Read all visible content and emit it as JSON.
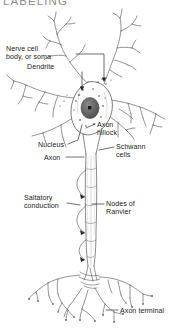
{
  "heading": "LABELING",
  "figure": {
    "style": "pencil-sketch line art",
    "background_color": "#ffffff",
    "ink_color": "#4a4a4a",
    "nucleus_color": "#6b6b6b"
  },
  "labels": [
    {
      "id": "soma",
      "text": "Nerve cell\nbody, or soma",
      "x": 6,
      "y": 45,
      "align": "left"
    },
    {
      "id": "dendrite",
      "text": "Dendrite",
      "x": 27,
      "y": 63,
      "align": "left"
    },
    {
      "id": "axon-hillock",
      "text": "Axon\nhillock",
      "x": 97,
      "y": 121,
      "align": "left"
    },
    {
      "id": "nucleus",
      "text": "Nucleus",
      "x": 38,
      "y": 141,
      "align": "left"
    },
    {
      "id": "schwann",
      "text": "Schwann\ncells",
      "x": 116,
      "y": 143,
      "align": "left"
    },
    {
      "id": "axon",
      "text": "Axon",
      "x": 44,
      "y": 154,
      "align": "left"
    },
    {
      "id": "saltatory",
      "text": "Saltatory\nconduction",
      "x": 24,
      "y": 194,
      "align": "left"
    },
    {
      "id": "nodes",
      "text": "Nodes of\nRanvier",
      "x": 106,
      "y": 200,
      "align": "left"
    },
    {
      "id": "terminal",
      "text": "Axon terminal",
      "x": 120,
      "y": 307,
      "align": "left"
    }
  ]
}
